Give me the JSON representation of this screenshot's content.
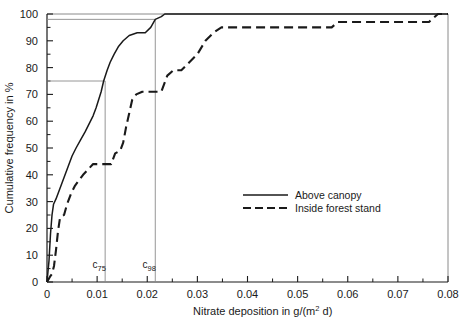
{
  "chart_data": {
    "type": "line",
    "title": "",
    "xlabel": "Nitrate deposition in g/(m2 d)",
    "xlabel_prefix": "Nitrate deposition in g/(m",
    "xlabel_exponent": "2",
    "xlabel_suffix": " d)",
    "ylabel": "Cumulative frequency in %",
    "xlim": [
      0,
      0.08
    ],
    "ylim": [
      0,
      100
    ],
    "xticks": [
      0,
      0.01,
      0.02,
      0.03,
      0.04,
      0.05,
      0.06,
      0.07,
      0.08
    ],
    "xtick_labels": [
      "0",
      "0.01",
      "0.02",
      "0.03",
      "0.04",
      "0.05",
      "0.06",
      "0.07",
      "0.08"
    ],
    "xminor_step": 0.005,
    "yticks": [
      0,
      10,
      20,
      30,
      40,
      50,
      60,
      70,
      80,
      90,
      100
    ],
    "ytick_labels": [
      "0",
      "10",
      "20",
      "30",
      "40",
      "50",
      "60",
      "70",
      "80",
      "90",
      "100"
    ],
    "yminor_step": 5,
    "grid": false,
    "legend_position": "lower-right-inside",
    "series": [
      {
        "name": "Above canopy",
        "style": "solid",
        "color": "#1a1a1a",
        "points": [
          [
            0.0,
            0
          ],
          [
            0.0004,
            8
          ],
          [
            0.0007,
            18
          ],
          [
            0.001,
            25
          ],
          [
            0.0013,
            29
          ],
          [
            0.0018,
            31
          ],
          [
            0.0026,
            35
          ],
          [
            0.0034,
            39
          ],
          [
            0.0042,
            43
          ],
          [
            0.005,
            47
          ],
          [
            0.0058,
            50
          ],
          [
            0.0067,
            53
          ],
          [
            0.0076,
            56
          ],
          [
            0.0084,
            59
          ],
          [
            0.0092,
            62
          ],
          [
            0.0098,
            65
          ],
          [
            0.0103,
            68
          ],
          [
            0.0108,
            71
          ],
          [
            0.0113,
            75
          ],
          [
            0.012,
            79
          ],
          [
            0.0126,
            82
          ],
          [
            0.0134,
            85
          ],
          [
            0.0143,
            88
          ],
          [
            0.0152,
            90
          ],
          [
            0.0164,
            92
          ],
          [
            0.018,
            93
          ],
          [
            0.0196,
            93
          ],
          [
            0.0207,
            95
          ],
          [
            0.0216,
            98
          ],
          [
            0.0228,
            99
          ],
          [
            0.0235,
            100
          ],
          [
            0.08,
            100
          ]
        ]
      },
      {
        "name": "Inside forest stand",
        "style": "dashed",
        "color": "#1a1a1a",
        "points": [
          [
            0.0,
            0
          ],
          [
            0.0006,
            2
          ],
          [
            0.001,
            3
          ],
          [
            0.0014,
            6
          ],
          [
            0.0018,
            12
          ],
          [
            0.0022,
            19
          ],
          [
            0.0026,
            24
          ],
          [
            0.0034,
            25
          ],
          [
            0.004,
            29
          ],
          [
            0.0048,
            33
          ],
          [
            0.0056,
            36
          ],
          [
            0.0064,
            38
          ],
          [
            0.0072,
            40
          ],
          [
            0.0082,
            42
          ],
          [
            0.0092,
            44
          ],
          [
            0.0108,
            44
          ],
          [
            0.0128,
            44
          ],
          [
            0.0136,
            48
          ],
          [
            0.0146,
            49
          ],
          [
            0.0152,
            52
          ],
          [
            0.0158,
            58
          ],
          [
            0.0164,
            63
          ],
          [
            0.017,
            68
          ],
          [
            0.0178,
            70
          ],
          [
            0.019,
            71
          ],
          [
            0.021,
            71
          ],
          [
            0.0228,
            71
          ],
          [
            0.024,
            77
          ],
          [
            0.0252,
            79
          ],
          [
            0.0268,
            79
          ],
          [
            0.0284,
            82
          ],
          [
            0.03,
            85
          ],
          [
            0.0316,
            90
          ],
          [
            0.0332,
            93
          ],
          [
            0.0348,
            95
          ],
          [
            0.037,
            95
          ],
          [
            0.042,
            95
          ],
          [
            0.048,
            95
          ],
          [
            0.054,
            95
          ],
          [
            0.0568,
            95
          ],
          [
            0.058,
            97
          ],
          [
            0.062,
            97
          ],
          [
            0.068,
            97
          ],
          [
            0.074,
            97
          ],
          [
            0.0762,
            97
          ],
          [
            0.078,
            100
          ],
          [
            0.08,
            100
          ]
        ]
      }
    ],
    "annotations": [
      {
        "name": "c75",
        "label_base": "c",
        "label_sub": "75",
        "x": 0.0116,
        "y": 75,
        "vline_from": 0,
        "vline_to": 75,
        "hline": true,
        "hline_y": 75
      },
      {
        "name": "c98",
        "label_base": "c",
        "label_sub": "98",
        "x": 0.0216,
        "y": 98,
        "vline_from": 0,
        "vline_to": 98,
        "hline": true,
        "hline_y": 98
      }
    ],
    "legend": [
      {
        "label": "Above canopy",
        "style": "solid"
      },
      {
        "label": "Inside forest stand",
        "style": "dashed"
      }
    ]
  }
}
